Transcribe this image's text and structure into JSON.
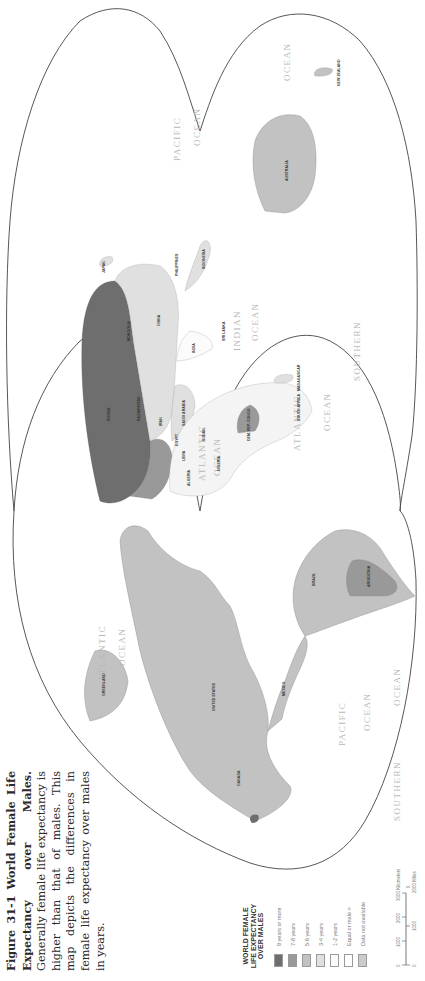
{
  "figure": {
    "number": "Figure 31-1",
    "title": "World Female Life Expectancy over Males.",
    "body": "Generally female life expectancy is higher than that of males. This map depicts the differences in female life expectancy over males in years."
  },
  "legend": {
    "title_lines": [
      "WORLD FEMALE",
      "LIFE EXPECTANCY",
      "OVER MALES"
    ],
    "items": [
      {
        "label": "9 years or more",
        "color": "#6e6e6e"
      },
      {
        "label": "7-8 years",
        "color": "#999999"
      },
      {
        "label": "5-6 years",
        "color": "#c2c2c2"
      },
      {
        "label": "3-4 years",
        "color": "#e0e0e0"
      },
      {
        "label": "1-2 years",
        "color": "#fbfbfb"
      },
      {
        "label": "Equal or male >",
        "color": "#ffffff"
      },
      {
        "label": "Data not available",
        "color": "#cccccc"
      }
    ]
  },
  "scale": {
    "km_ticks": [
      "0",
      "1000",
      "2000",
      "3000 Kilometers"
    ],
    "mi_ticks": [
      "0",
      "1000",
      "2000 Miles"
    ]
  },
  "map": {
    "oceans": {
      "atlantic_north_w": "ATLANTIC",
      "ocean_north_w": "OCEAN",
      "pacific_east": "PACIFIC",
      "ocean_pacific_east": "OCEAN",
      "southern_west": "SOUTHERN",
      "ocean_southern_west": "OCEAN",
      "atlantic_ne": "ATLANTIC",
      "ocean_ne": "OCEAN",
      "atlantic_south": "ATLANTIC",
      "ocean_south": "OCEAN",
      "indian": "INDIAN",
      "ocean_indian": "OCEAN",
      "southern_east": "SOUTHERN",
      "pacific_west": "PACIFIC",
      "ocean_pacific_west": "OCEAN",
      "ocean_far_east": "OCEAN"
    },
    "countries": {
      "canada": "CANADA",
      "united_states": "UNITED STATES",
      "mexico": "MEXICO",
      "brazil": "BRAZIL",
      "argentina": "ARGENTINA",
      "russia": "RUSSIA",
      "china": "CHINA",
      "india": "INDIA",
      "australia": "AUSTRALIA",
      "new_zealand": "NEW ZEALAND",
      "japan": "JAPAN",
      "indonesia": "INDONESIA",
      "kazakhstan": "KAZAKHSTAN",
      "mongolia": "MONGOLIA",
      "algeria": "ALGERIA",
      "libya": "LIBYA",
      "egypt": "EGYPT",
      "sudan": "SUDAN",
      "nigeria": "NIGERIA",
      "congo": "DEM. REP. CONGO",
      "south_africa": "SOUTH AFRICA",
      "madagascar": "MADAGASCAR",
      "saudi_arabia": "SAUDI ARABIA",
      "iran": "IRAN",
      "greenland": "GREENLAND",
      "philippines": "PHILIPPINES",
      "sri_lanka": "SRI LANKA"
    }
  }
}
